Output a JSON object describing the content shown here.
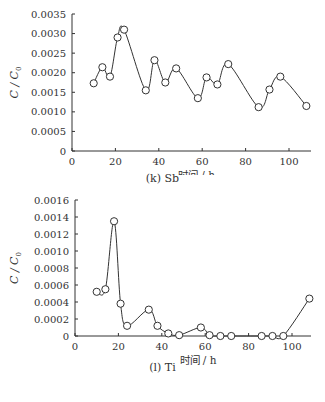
{
  "chart_data": [
    {
      "type": "line",
      "title": "(k) Sb",
      "xlabel": "时间/h",
      "ylabel": "C/C0",
      "xlim": [
        0,
        110
      ],
      "ylim": [
        0,
        0.0035
      ],
      "xticks": [
        "0",
        "20",
        "40",
        "60",
        "80",
        "100"
      ],
      "yticks": [
        "0",
        "0.0005",
        "0.0010",
        "0.0015",
        "0.0020",
        "0.0025",
        "0.0030",
        "0.0035"
      ],
      "grid": false,
      "legend": null,
      "marker": "open-circle",
      "smooth": true,
      "series": [
        {
          "name": "Sb",
          "x": [
            10,
            14,
            17.5,
            21,
            24,
            34,
            38,
            43,
            48,
            58,
            62,
            67,
            72,
            86,
            91,
            96,
            108
          ],
          "values": [
            0.00173,
            0.00214,
            0.0019,
            0.0029,
            0.0031,
            0.00155,
            0.00232,
            0.00175,
            0.00211,
            0.00135,
            0.00188,
            0.0017,
            0.00222,
            0.00112,
            0.00157,
            0.0019,
            0.00115
          ]
        }
      ]
    },
    {
      "type": "line",
      "title": "(l) Ti",
      "xlabel": "时间/h",
      "ylabel": "C/C0",
      "xlim": [
        0,
        110
      ],
      "ylim": [
        0,
        0.0016
      ],
      "xticks": [
        "0",
        "20",
        "40",
        "60",
        "80",
        "100"
      ],
      "yticks": [
        "0",
        "0.0002",
        "0.0004",
        "0.0006",
        "0.0008",
        "0.0010",
        "0.0012",
        "0.0014",
        "0.0016"
      ],
      "grid": false,
      "legend": null,
      "marker": "open-circle",
      "smooth": true,
      "series": [
        {
          "name": "Ti",
          "x": [
            10,
            14,
            18,
            21,
            24,
            34,
            38,
            43,
            48,
            58,
            62,
            67,
            72,
            86,
            91,
            96,
            108
          ],
          "values": [
            0.00052,
            0.00055,
            0.00135,
            0.00038,
            0.00012,
            0.00031,
            0.00012,
            3e-05,
            1e-05,
            0.0001,
            1e-05,
            0.0,
            0.0,
            0.0,
            0.0,
            0.0,
            0.00044
          ]
        }
      ]
    }
  ],
  "labels": {
    "top_caption": "(k)  Sb",
    "bottom_caption": "(l)  Ti",
    "xlabel": "时间 / h",
    "ylabel_main": "C / C",
    "ylabel_sub": "0"
  }
}
